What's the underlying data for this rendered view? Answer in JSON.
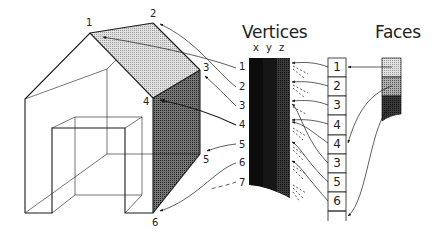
{
  "titles": {
    "vertices": "Vertices",
    "faces": "Faces"
  },
  "axes": [
    "x",
    "y",
    "z"
  ],
  "house_vertex_labels": [
    {
      "label": "1",
      "x": 86,
      "y": 18
    },
    {
      "label": "2",
      "x": 150,
      "y": 9
    },
    {
      "label": "3",
      "x": 203,
      "y": 63
    },
    {
      "label": "4",
      "x": 143,
      "y": 97
    },
    {
      "label": "5",
      "x": 203,
      "y": 155
    },
    {
      "label": "6",
      "x": 152,
      "y": 218
    }
  ],
  "vertex_row_labels": [
    {
      "label": "1",
      "y": 62
    },
    {
      "label": "2",
      "y": 82
    },
    {
      "label": "3",
      "y": 101
    },
    {
      "label": "4",
      "y": 120
    },
    {
      "label": "5",
      "y": 140
    },
    {
      "label": "6",
      "y": 158
    },
    {
      "label": "7",
      "y": 178
    }
  ],
  "face_vertex_indices": [
    "1",
    "2",
    "3",
    "4",
    "4",
    "3",
    "5",
    "6"
  ],
  "faces": [
    {
      "name": "roof-face",
      "shade": "#c9c9c9"
    },
    {
      "name": "gable-face",
      "shade": "#8e8e8e"
    },
    {
      "name": "side-wall-face",
      "shade": "#3a3a3a"
    }
  ],
  "colors": {
    "line": "#1a1a1a",
    "roof": "#d4d4d4",
    "side_wall": "#5a5a5a",
    "table_dark": "#0c0c0c",
    "table_z": "#2c2c2c"
  }
}
